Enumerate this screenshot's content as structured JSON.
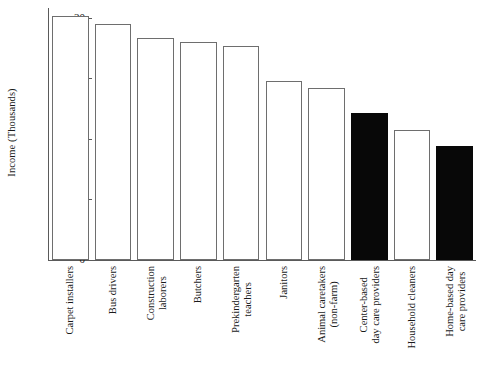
{
  "chart_data": {
    "type": "bar",
    "title": "",
    "xlabel": "",
    "ylabel": "Income (Thousands)",
    "ylim": [
      0,
      20.8
    ],
    "yticks": [
      0,
      5,
      10,
      15,
      20
    ],
    "ytick_labels": [
      "0",
      "5",
      "10",
      "15",
      "20"
    ],
    "grid": false,
    "legend": "none",
    "categories": [
      "Carpet installers",
      "Bus drivers",
      "Construction laborers",
      "Butchers",
      "Prekindergarten teachers",
      "Janitors",
      "Animal caretakers (non-farm)",
      "Center-based day care providers",
      "Household cleaners",
      "Home-based day care providers"
    ],
    "category_lines": [
      [
        "Carpet installers"
      ],
      [
        "Bus drivers"
      ],
      [
        "Construction",
        "laborers"
      ],
      [
        "Butchers"
      ],
      [
        "Prekindergarten",
        "teachers"
      ],
      [
        "Janitors"
      ],
      [
        "Animal caretakers",
        "(non-farm)"
      ],
      [
        "Center-based",
        "day care providers"
      ],
      [
        "Household cleaners"
      ],
      [
        "Home-based day",
        "care providers"
      ]
    ],
    "values": [
      20.1,
      19.5,
      18.3,
      18.0,
      17.7,
      14.8,
      14.2,
      12.1,
      10.7,
      9.4
    ],
    "bar_styles": [
      "open",
      "open",
      "open",
      "open",
      "open",
      "open",
      "open",
      "filled",
      "open",
      "filled"
    ],
    "colors": {
      "open_fill": "#ffffff",
      "open_stroke": "#6e6e6e",
      "filled_fill": "#080808",
      "axis": "#5a5a5a",
      "text": "#1a1a1a",
      "background": "#ffffff"
    }
  }
}
